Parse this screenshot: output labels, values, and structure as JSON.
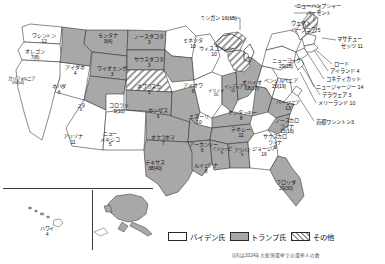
{
  "map": {
    "title": "2020 United States presidential election electoral map",
    "states": [
      {
        "name": "ワシントン",
        "votes": "12",
        "x": 24,
        "y": 33,
        "w": 40,
        "fill": "biden"
      },
      {
        "name": "オレゴン",
        "votes": "7(8)",
        "x": 16,
        "y": 49,
        "w": 38,
        "fill": "biden"
      },
      {
        "name": "カリフォルニア",
        "votes": "55(54)",
        "x": 8,
        "y": 76,
        "w": 20,
        "fill": "biden"
      },
      {
        "name": "ネバダ",
        "votes": "6",
        "x": 44,
        "y": 84,
        "w": 30,
        "fill": "biden"
      },
      {
        "name": "アイダホ",
        "votes": "4",
        "x": 61,
        "y": 65,
        "w": 28,
        "fill": "trump"
      },
      {
        "name": "モンタナ",
        "votes": "3(4)",
        "x": 92,
        "y": 33,
        "w": 32,
        "fill": "trump"
      },
      {
        "name": "ワイオミング",
        "votes": "3",
        "x": 95,
        "y": 66,
        "w": 34,
        "fill": "trump"
      },
      {
        "name": "ユタ",
        "votes": "6",
        "x": 70,
        "y": 103,
        "w": 22,
        "fill": "trump"
      },
      {
        "name": "コロラド",
        "votes": "9(10)",
        "x": 101,
        "y": 103,
        "w": 36,
        "fill": "biden"
      },
      {
        "name": "アリゾナ",
        "votes": "11",
        "x": 56,
        "y": 134,
        "w": 34,
        "fill": "biden"
      },
      {
        "name": "ニュー\nメキシコ",
        "votes": "5",
        "x": 94,
        "y": 131,
        "w": 32,
        "fill": "biden"
      },
      {
        "name": "ノースダコタ",
        "votes": "3",
        "x": 131,
        "y": 34,
        "w": 36,
        "fill": "trump"
      },
      {
        "name": "サウスダコタ",
        "votes": "3",
        "x": 131,
        "y": 57,
        "w": 36,
        "fill": "trump"
      },
      {
        "name": "ネブラスカ",
        "votes": "5",
        "x": 131,
        "y": 84,
        "w": 36,
        "fill": "other"
      },
      {
        "name": "カンザス",
        "votes": "6",
        "x": 142,
        "y": 108,
        "w": 32,
        "fill": "trump"
      },
      {
        "name": "オクラホマ",
        "votes": "7",
        "x": 146,
        "y": 135,
        "w": 34,
        "fill": "trump"
      },
      {
        "name": "テキサス",
        "votes": "38(40)",
        "x": 137,
        "y": 160,
        "w": 36,
        "fill": "trump"
      },
      {
        "name": "ミネソタ",
        "votes": "10",
        "x": 180,
        "y": 38,
        "w": 26,
        "fill": "biden"
      },
      {
        "name": "アイオワ",
        "votes": "6",
        "x": 180,
        "y": 83,
        "w": 26,
        "fill": "trump"
      },
      {
        "name": "ミズーリ",
        "votes": "10",
        "x": 186,
        "y": 114,
        "w": 26,
        "fill": "trump"
      },
      {
        "name": "アーカンソー",
        "votes": "6",
        "x": 189,
        "y": 142,
        "w": 26,
        "fill": "trump"
      },
      {
        "name": "ルイジアナ",
        "votes": "8",
        "x": 193,
        "y": 163,
        "w": 26,
        "fill": "trump"
      },
      {
        "name": "ウィスコンシン",
        "votes": "10",
        "x": 199,
        "y": 46,
        "w": 30,
        "fill": "biden"
      },
      {
        "name": "イリノイ",
        "votes": "20",
        "x": 207,
        "y": 88,
        "w": 18,
        "fill": "biden"
      },
      {
        "name": "インディアナ",
        "votes": "11",
        "x": 224,
        "y": 84,
        "w": 18,
        "fill": "trump"
      },
      {
        "name": "オハイオ",
        "votes": "18(17)",
        "x": 240,
        "y": 80,
        "w": 24,
        "fill": "trump"
      },
      {
        "name": "ケンタッキー",
        "votes": "8",
        "x": 228,
        "y": 110,
        "w": 26,
        "fill": "trump"
      },
      {
        "name": "テネシー",
        "votes": "11",
        "x": 228,
        "y": 127,
        "w": 26,
        "fill": "trump"
      },
      {
        "name": "ミシシッピ",
        "votes": "6",
        "x": 211,
        "y": 146,
        "w": 22,
        "fill": "trump"
      },
      {
        "name": "アラバマ",
        "votes": "9",
        "x": 231,
        "y": 148,
        "w": 22,
        "fill": "trump"
      },
      {
        "name": "ジョージア",
        "votes": "16",
        "x": 252,
        "y": 146,
        "w": 24,
        "fill": "biden"
      },
      {
        "name": "フロリダ",
        "votes": "29(30)",
        "x": 272,
        "y": 180,
        "w": 28,
        "fill": "trump"
      },
      {
        "name": "ニューヨーク",
        "votes": "29(28)",
        "x": 272,
        "y": 58,
        "w": 28,
        "fill": "biden"
      },
      {
        "name": "ペンシルベニア",
        "votes": "20(19)",
        "x": 264,
        "y": 78,
        "w": 30,
        "fill": "biden"
      },
      {
        "name": "バージニア",
        "votes": "13",
        "x": 276,
        "y": 100,
        "w": 24,
        "fill": "biden"
      },
      {
        "name": "ノースカロ\nライナ",
        "votes": "15(16)",
        "x": 272,
        "y": 118,
        "w": 30,
        "fill": "trump"
      },
      {
        "name": "サウスカロ\nライナ",
        "votes": "9",
        "x": 262,
        "y": 134,
        "w": 26,
        "fill": "trump"
      },
      {
        "name": "ハワイ",
        "votes": "4",
        "x": 30,
        "y": 226,
        "w": 34,
        "fill": "biden"
      }
    ],
    "callouts_top": [
      {
        "label": "ミシガン 16(15)",
        "x": 200,
        "y": 15
      },
      {
        "label": "ニューハンプシャー",
        "x": 296,
        "y": 3
      },
      {
        "label": "バーモント",
        "x": 306,
        "y": 10
      },
      {
        "label": "ウェスト",
        "x": 291,
        "y": 20
      },
      {
        "label": "バージニア 5",
        "x": 291,
        "y": 27
      }
    ],
    "callouts_right": [
      {
        "label": "マサチュー",
        "x": 337,
        "y": 36
      },
      {
        "label": "セッツ 11",
        "x": 341,
        "y": 43
      },
      {
        "label": "ロード",
        "x": 334,
        "y": 61
      },
      {
        "label": "アイランド 4",
        "x": 330,
        "y": 68
      },
      {
        "label": "コネティカット",
        "x": 326,
        "y": 76
      },
      {
        "label": "ニュージャージー 14",
        "x": 316,
        "y": 84
      },
      {
        "label": "デラウェア 3",
        "x": 322,
        "y": 92
      },
      {
        "label": "メリーランド 10",
        "x": 318,
        "y": 100
      },
      {
        "label": "首都ワシントン3",
        "x": 316,
        "y": 119
      }
    ]
  },
  "legend": {
    "items": [
      {
        "label": "バイデン氏",
        "swatch": "biden"
      },
      {
        "label": "トランプ氏",
        "swatch": "trump"
      },
      {
        "label": "その他",
        "swatch": "other"
      }
    ]
  },
  "footnote": "()内は2024年大統領選挙での選挙人の数",
  "colors": {
    "biden": "#ffffff",
    "trump": "#a8a8a8",
    "other_hatch": "#9a9a9a",
    "outline": "#2b2b2b",
    "background": "#ffffff"
  }
}
